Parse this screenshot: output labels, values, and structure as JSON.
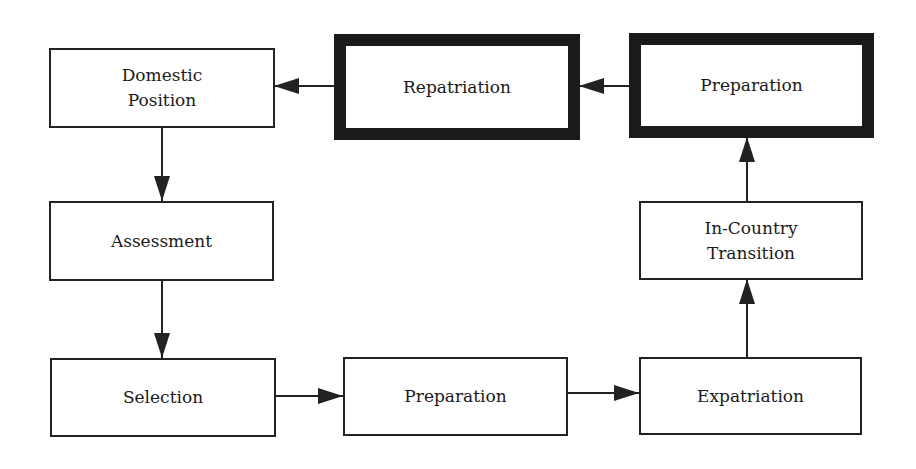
{
  "diagram": {
    "type": "flowchart",
    "nodes": [
      {
        "id": "domestic_position",
        "label": "Domestic\nPosition",
        "emphasis": false
      },
      {
        "id": "repatriation",
        "label": "Repatriation",
        "emphasis": true
      },
      {
        "id": "preparation_return",
        "label": "Preparation",
        "emphasis": true
      },
      {
        "id": "assessment",
        "label": "Assessment",
        "emphasis": false
      },
      {
        "id": "in_country_transition",
        "label": "In-Country\nTransition",
        "emphasis": false
      },
      {
        "id": "selection",
        "label": "Selection",
        "emphasis": false
      },
      {
        "id": "preparation_departure",
        "label": "Preparation",
        "emphasis": false
      },
      {
        "id": "expatriation",
        "label": "Expatriation",
        "emphasis": false
      }
    ],
    "edges": [
      {
        "from": "domestic_position",
        "to": "assessment"
      },
      {
        "from": "assessment",
        "to": "selection"
      },
      {
        "from": "selection",
        "to": "preparation_departure"
      },
      {
        "from": "preparation_departure",
        "to": "expatriation"
      },
      {
        "from": "expatriation",
        "to": "in_country_transition"
      },
      {
        "from": "in_country_transition",
        "to": "preparation_return"
      },
      {
        "from": "preparation_return",
        "to": "repatriation"
      },
      {
        "from": "repatriation",
        "to": "domestic_position"
      }
    ],
    "colors": {
      "stroke": "#222222",
      "background": "#ffffff"
    }
  }
}
